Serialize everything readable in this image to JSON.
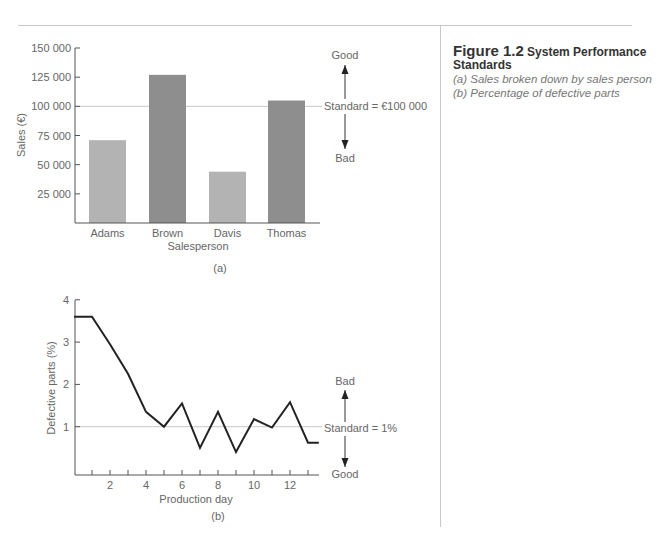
{
  "caption": {
    "figure_number": "Figure 1.2",
    "title": "System Performance Standards",
    "items": [
      "(a) Sales broken down by sales person",
      "(b) Percentage of defective parts"
    ]
  },
  "chart_data": [
    {
      "type": "bar",
      "panel_label": "(a)",
      "title": "",
      "xlabel": "Salesperson",
      "ylabel": "Sales (€)",
      "categories": [
        "Adams",
        "Brown",
        "Davis",
        "Thomas"
      ],
      "values": [
        71000,
        127000,
        44000,
        105000
      ],
      "bar_colors": [
        "#b3b3b3",
        "#8e8e8e",
        "#b3b3b3",
        "#8e8e8e"
      ],
      "ylim": [
        0,
        150000
      ],
      "yticks": [
        25000,
        50000,
        75000,
        100000,
        125000,
        150000
      ],
      "ytick_labels": [
        "25 000",
        "50 000",
        "75 000",
        "100 000",
        "125 000",
        "150 000"
      ],
      "reference_line": {
        "value": 100000,
        "label": "Standard = €100 000"
      },
      "annotations": {
        "up": "Good",
        "down": "Bad"
      },
      "grid": false
    },
    {
      "type": "line",
      "panel_label": "(b)",
      "title": "",
      "xlabel": "Production day",
      "ylabel": "Defective parts (%)",
      "x": [
        0,
        1,
        2,
        3,
        4,
        5,
        6,
        7,
        8,
        9,
        10,
        11,
        12,
        13,
        13.6
      ],
      "series": [
        {
          "name": "Defective parts",
          "values": [
            3.6,
            3.6,
            2.95,
            2.25,
            1.35,
            1.0,
            1.55,
            0.5,
            1.35,
            0.4,
            1.18,
            0.98,
            1.58,
            0.62,
            0.62
          ]
        }
      ],
      "xlim": [
        0,
        13.6
      ],
      "ylim": [
        0,
        4
      ],
      "xticks": [
        2,
        4,
        6,
        8,
        10,
        12
      ],
      "yticks": [
        1,
        2,
        3,
        4
      ],
      "reference_line": {
        "value": 1,
        "label": "Standard = 1%"
      },
      "annotations": {
        "up": "Bad",
        "down": "Good"
      },
      "grid": false
    }
  ]
}
